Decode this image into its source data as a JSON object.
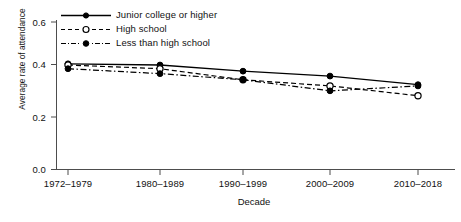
{
  "chart_data": {
    "type": "line",
    "title": "",
    "subtitle": "",
    "xlabel": "Decade",
    "ylabel": "Average rate of attendance",
    "categories": [
      "1972–1979",
      "1980–1989",
      "1990–1999",
      "2000–2009",
      "2010–2018"
    ],
    "yticks": [
      "0.0",
      "0.2",
      "0.4",
      "0.6"
    ],
    "ytick_values": [
      0.0,
      0.2,
      0.4,
      0.6
    ],
    "ylim": [
      0.0,
      0.6
    ],
    "grid": false,
    "legend_position": "top-left inside",
    "series": [
      {
        "name": "Junior college or higher",
        "values": [
          0.43,
          0.425,
          0.4,
          0.38,
          0.345
        ],
        "line_style": "solid",
        "marker": "filled-circle",
        "color": "#000000"
      },
      {
        "name": "High school",
        "values": [
          0.425,
          0.41,
          0.365,
          0.34,
          0.3
        ],
        "line_style": "dashed",
        "marker": "open-circle",
        "color": "#000000"
      },
      {
        "name": "Less than high school",
        "values": [
          0.41,
          0.39,
          0.365,
          0.32,
          0.34
        ],
        "line_style": "dash-dot",
        "marker": "filled-circle",
        "color": "#000000"
      }
    ]
  },
  "legend": {
    "items": [
      {
        "label": "Junior college or higher"
      },
      {
        "label": "High school"
      },
      {
        "label": "Less than high school"
      }
    ]
  },
  "axes": {
    "ylabel": "Average rate of attendance",
    "xlabel": "Decade",
    "ytick_0": "0.0",
    "ytick_1": "0.2",
    "ytick_2": "0.4",
    "ytick_3": "0.6",
    "xtick_0": "1972–1979",
    "xtick_1": "1980–1989",
    "xtick_2": "1990–1999",
    "xtick_3": "2000–2009",
    "xtick_4": "2010–2018"
  },
  "colors": {
    "ink": "#000000",
    "axis": "#555555",
    "background": "#ffffff"
  }
}
